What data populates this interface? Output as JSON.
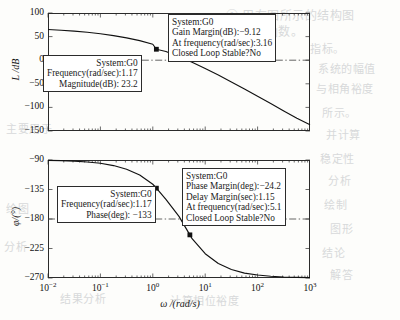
{
  "figure": {
    "kind": "bode-plot",
    "system": "G0"
  },
  "axes": {
    "magnitude": {
      "ylabel": "L /dB",
      "yticks": [
        "100",
        "50",
        "0",
        "-50",
        "-100",
        "-150"
      ],
      "yvalues": [
        100,
        50,
        0,
        -50,
        -100,
        -150
      ],
      "ylim": [
        -150,
        100
      ]
    },
    "phase": {
      "ylabel": "φ/(°)",
      "yticks": [
        "-90",
        "-135",
        "-180",
        "-225",
        "-270"
      ],
      "yvalues": [
        -90,
        -135,
        -180,
        -225,
        -270
      ],
      "ylim": [
        -270,
        -90
      ]
    },
    "x": {
      "label": "ω /(rad/s)",
      "ticks": [
        {
          "mantissa": "10",
          "exp": "-2",
          "value": 0.01
        },
        {
          "mantissa": "10",
          "exp": "-1",
          "value": 0.1
        },
        {
          "mantissa": "10",
          "exp": "0",
          "value": 1
        },
        {
          "mantissa": "10",
          "exp": "1",
          "value": 10
        },
        {
          "mantissa": "10",
          "exp": "2",
          "value": 100
        },
        {
          "mantissa": "10",
          "exp": "3",
          "value": 1000
        }
      ],
      "scale": "log",
      "xlim": [
        0.01,
        1000
      ]
    }
  },
  "annotations": {
    "gain_margin": {
      "line1": "System:G0",
      "line2": "Gain Margin(dB):−9.12",
      "line3": "At frequency(rad/sec):3.16",
      "line4": "Closed Loop Stable?No"
    },
    "magnitude_point": {
      "line1": "System:G0",
      "line2": "Frequency(rad/sec):1.17",
      "line3": "Magnitude(dB): 23.2"
    },
    "phase_margin": {
      "line1": "System:G0",
      "line2": "Phase Margin(deg):−24.2",
      "line3": "Delay Margin(sec):1.15",
      "line4": "At frequency(rad/sec):5.1",
      "line5": "Closed Loop Stable?No"
    },
    "phase_point": {
      "line1": "System:G0",
      "line2": "Frequency(rad/sec):1.17",
      "line3": "Phase(deg): −133"
    }
  },
  "chart_data": {
    "type": "line",
    "title": "",
    "xlabel": "ω /(rad/s)",
    "xscale": "log",
    "xlim": [
      0.01,
      1000
    ],
    "grid": false,
    "legend": false,
    "subplots": [
      {
        "name": "magnitude",
        "ylabel": "L /dB",
        "ylim": [
          -150,
          100
        ],
        "series": [
          {
            "name": "L(ω)",
            "x": [
              0.01,
              0.0178,
              0.0316,
              0.0562,
              0.1,
              0.178,
              0.316,
              0.562,
              1.0,
              1.17,
              1.78,
              3.16,
              5.62,
              10,
              17.8,
              31.6,
              56.2,
              100,
              178,
              316,
              562,
              1000
            ],
            "y": [
              65.0,
              63.5,
              61.6,
              59.2,
              56.0,
              52.2,
              47.4,
              41.4,
              33.8,
              23.2,
              18.5,
              7.5,
              -4.5,
              -17.5,
              -31.5,
              -46.0,
              -61.0,
              -76.5,
              -92.0,
              -107.5,
              -123.0,
              -137.0
            ]
          }
        ],
        "markers": [
          {
            "x": 1.17,
            "y": 23.2,
            "label": "magnitude-datatip"
          },
          {
            "x": 3.16,
            "y": 9.12,
            "label": "gain-margin-point"
          }
        ],
        "reference_lines": [
          {
            "type": "horizontal",
            "y": 0,
            "style": "dash-dot"
          }
        ]
      },
      {
        "name": "phase",
        "ylabel": "φ/(°)",
        "ylim": [
          -270,
          -90
        ],
        "series": [
          {
            "name": "φ(ω)",
            "x": [
              0.01,
              0.0178,
              0.0316,
              0.0562,
              0.1,
              0.178,
              0.316,
              0.562,
              1.0,
              1.17,
              1.78,
              3.16,
              5.1,
              5.62,
              10,
              17.8,
              31.6,
              56.2,
              100,
              178,
              316,
              562,
              1000
            ],
            "y": [
              -90.5,
              -91.0,
              -91.8,
              -93.0,
              -95.0,
              -98.5,
              -104.0,
              -113.0,
              -127.0,
              -133.0,
              -150.0,
              -176.0,
              -204.2,
              -210.0,
              -233.0,
              -248.0,
              -257.0,
              -262.5,
              -265.5,
              -267.3,
              -268.4,
              -269.0,
              -269.4
            ]
          }
        ],
        "markers": [
          {
            "x": 1.17,
            "y": -133,
            "label": "phase-datatip"
          },
          {
            "x": 5.1,
            "y": -204.2,
            "label": "phase-margin-point"
          }
        ],
        "reference_lines": [
          {
            "type": "horizontal",
            "y": -180,
            "style": "dash-dot"
          }
        ]
      }
    ]
  },
  "bleed_text": [
    {
      "t": "① 用右图所示的结构图",
      "x": 226,
      "y": 6,
      "size": 12
    },
    {
      "t": "的传递函数。",
      "x": 228,
      "y": 22,
      "size": 12
    },
    {
      "t": "指标。",
      "x": 310,
      "y": 40,
      "size": 11
    },
    {
      "t": "系统的幅值",
      "x": 318,
      "y": 60,
      "size": 11
    },
    {
      "t": "与相角裕度",
      "x": 316,
      "y": 80,
      "size": 11
    },
    {
      "t": "所示。",
      "x": 322,
      "y": 104,
      "size": 11
    },
    {
      "t": "并计算",
      "x": 326,
      "y": 126,
      "size": 11
    },
    {
      "t": "稳定性",
      "x": 320,
      "y": 150,
      "size": 11
    },
    {
      "t": "分析",
      "x": 328,
      "y": 172,
      "size": 11
    },
    {
      "t": "绘制",
      "x": 324,
      "y": 196,
      "size": 11
    },
    {
      "t": "图形",
      "x": 330,
      "y": 220,
      "size": 11
    },
    {
      "t": "结论",
      "x": 322,
      "y": 244,
      "size": 11
    },
    {
      "t": "解答",
      "x": 330,
      "y": 266,
      "size": 11
    },
    {
      "t": "结果分析",
      "x": 60,
      "y": 290,
      "size": 11
    },
    {
      "t": "计算相位裕度",
      "x": 170,
      "y": 292,
      "size": 11
    },
    {
      "t": "主要用于",
      "x": 6,
      "y": 120,
      "size": 11
    },
    {
      "t": "绘图",
      "x": 6,
      "y": 200,
      "size": 11
    },
    {
      "t": "分析",
      "x": 4,
      "y": 238,
      "size": 11
    }
  ]
}
